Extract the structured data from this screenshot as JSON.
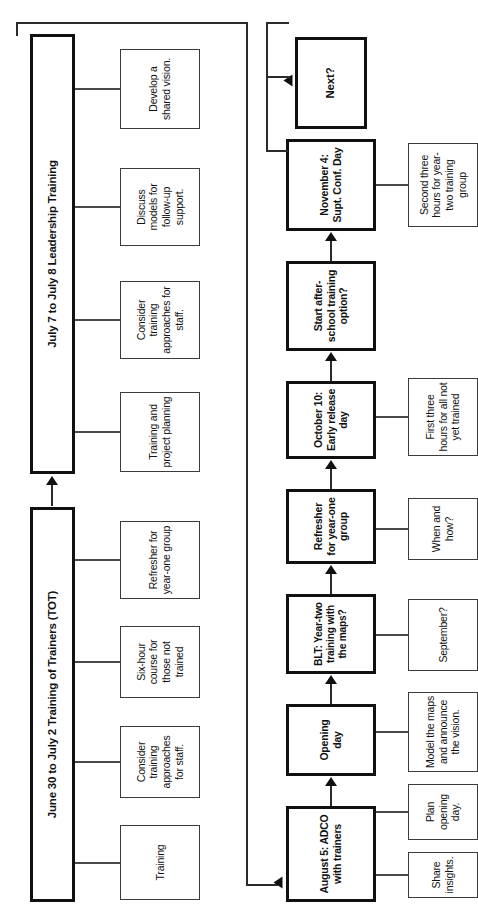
{
  "diagram": {
    "orientation": "rotated-90-ccw",
    "phases": [
      {
        "id": "tot",
        "label": "June 30 to July 2 Training of Trainers (TOT)",
        "children": [
          {
            "id": "tot-c1",
            "label": "Training"
          },
          {
            "id": "tot-c2",
            "label": "Consider training approaches for staff."
          },
          {
            "id": "tot-c3",
            "label": "Six-hour course for those not trained"
          },
          {
            "id": "tot-c4",
            "label": "Refresher for year-one group"
          }
        ]
      },
      {
        "id": "leadership",
        "label": "July 7 to July 8 Leadership Training",
        "children": [
          {
            "id": "ldr-c1",
            "label": "Training and project planning"
          },
          {
            "id": "ldr-c2",
            "label": "Consider training approaches for staff."
          },
          {
            "id": "ldr-c3",
            "label": "Discuss models for follow-up support."
          },
          {
            "id": "ldr-c4",
            "label": "Develop a shared vision."
          }
        ]
      }
    ],
    "timeline": [
      {
        "id": "aug5",
        "label": "August 5: ADCO with trainers",
        "notes": [
          {
            "id": "aug5-n1",
            "label": "Share insights."
          },
          {
            "id": "aug5-n2",
            "label": "Plan opening day."
          }
        ]
      },
      {
        "id": "opening",
        "label": "Opening day",
        "notes": [
          {
            "id": "opening-n1",
            "label": "Model the maps and announce the vision."
          }
        ]
      },
      {
        "id": "blt",
        "label": "BLT: Year-two training with the maps?",
        "notes": [
          {
            "id": "blt-n1",
            "label": "September?"
          }
        ]
      },
      {
        "id": "refresher",
        "label": "Refresher for year-one group",
        "notes": [
          {
            "id": "refresher-n1",
            "label": "When and how?"
          }
        ]
      },
      {
        "id": "oct10",
        "label": "October 10: Early release day",
        "notes": [
          {
            "id": "oct10-n1",
            "label": "First three hours for all not yet trained"
          }
        ]
      },
      {
        "id": "afterschool",
        "label": "Start after-school training option?",
        "notes": []
      },
      {
        "id": "nov4",
        "label": "November 4: Supt. Conf. Day",
        "notes": [
          {
            "id": "nov4-n1",
            "label": "Second three hours for year-two training group"
          }
        ]
      }
    ],
    "terminal": {
      "id": "next",
      "label": "Next?"
    }
  }
}
